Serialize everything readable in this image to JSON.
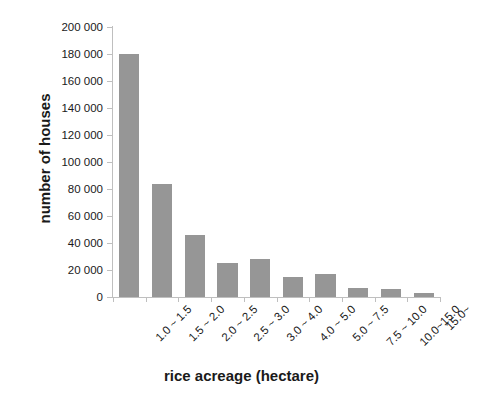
{
  "chart_data": {
    "type": "bar",
    "title": "",
    "xlabel": "rice acreage (hectare)",
    "ylabel": "number of houses",
    "categories": [
      "1.0 ~ 1.5",
      "1.5 ~ 2.0",
      "2.0 ~ 2.5",
      "2.5 ~ 3.0",
      "3.0 ~ 4.0",
      "4.0 ~ 5.0",
      "5.0 ~ 7.5",
      "7.5 ~ 10.0",
      "10.0~15.0",
      "15.0~"
    ],
    "values": [
      180000,
      84000,
      46000,
      25000,
      28000,
      15000,
      17000,
      7000,
      6000,
      3000
    ],
    "ylim": [
      0,
      200000
    ],
    "ytick_values": [
      0,
      20000,
      40000,
      60000,
      80000,
      100000,
      120000,
      140000,
      160000,
      180000,
      200000
    ],
    "ytick_labels": [
      "0",
      "20 000",
      "40 000",
      "60 000",
      "80 000",
      "100 000",
      "120 000",
      "140 000",
      "160 000",
      "180 000",
      "200 000"
    ],
    "grid": false,
    "legend": false,
    "bar_color": "#969696",
    "axis_color": "#bfbfbf",
    "text_color": "#1a1a1a"
  }
}
